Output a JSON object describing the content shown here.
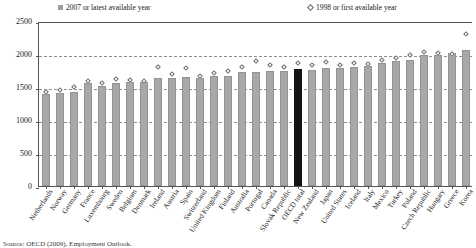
{
  "legend": {
    "series1_label": "2007 or latest available year",
    "series2_label": "1998 or first available year",
    "series1_color": "#9d9d9d",
    "series2_color": "#6b6b6b"
  },
  "source_note": "Source: OECD (2009), Employment Outlook.",
  "chart_data": {
    "type": "bar",
    "title": "",
    "xlabel": "",
    "ylabel": "",
    "ylim": [
      0,
      2500
    ],
    "yticks": [
      0,
      500,
      1000,
      1500,
      2000,
      2500
    ],
    "grid": true,
    "legend_position": "top",
    "highlight_category": "OECD total",
    "highlight_color": "#141414",
    "bar_color": "#a8a8a8",
    "categories": [
      "Netherlands",
      "Norway",
      "Germany",
      "France",
      "Luxembourg",
      "Sweden",
      "Belgium",
      "Denmark",
      "Ireland",
      "Austria",
      "Spain",
      "Switzerland",
      "United Kingdom",
      "Finland",
      "Australia",
      "Portugal",
      "Canada",
      "Slovak Republic",
      "OECD total",
      "New Zealand",
      "Japan",
      "United States",
      "Iceland",
      "Italy",
      "Mexico",
      "Turkey",
      "Poland",
      "Czech Republic",
      "Hungary",
      "Greece",
      "Korea"
    ],
    "series": [
      {
        "name": "2007 or latest available year",
        "values": [
          1392,
          1411,
          1432,
          1561,
          1515,
          1562,
          1577,
          1574,
          1630,
          1631,
          1652,
          1643,
          1670,
          1673,
          1721,
          1726,
          1738,
          1749,
          1768,
          1762,
          1785,
          1794,
          1807,
          1824,
          1871,
          1893,
          1904,
          1985,
          1988,
          2008,
          2060
        ]
      },
      {
        "name": "1998 or first available year",
        "values": [
          1420,
          1460,
          1500,
          1595,
          1560,
          1625,
          1600,
          1590,
          1800,
          1700,
          1790,
          1670,
          1710,
          1750,
          1800,
          1900,
          1830,
          1800,
          1860,
          1830,
          1880,
          1840,
          1860,
          1850,
          1910,
          1940,
          1990,
          2030,
          2020,
          2000,
          2300
        ]
      }
    ]
  }
}
